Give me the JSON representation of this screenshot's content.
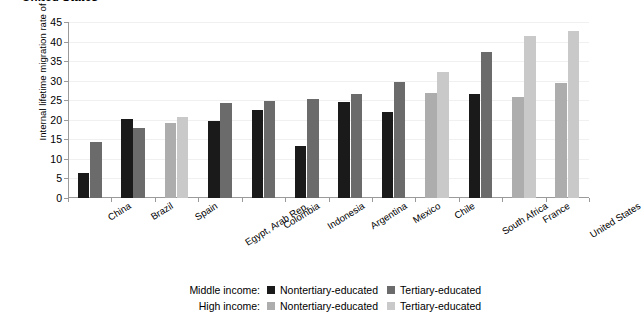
{
  "chart_data": {
    "type": "bar",
    "title": "United States",
    "xlabel": "",
    "ylabel": "Internal lifetime migration rate of the employed (%)",
    "ylim": [
      0,
      45
    ],
    "yticks": [
      0,
      5,
      10,
      15,
      20,
      25,
      30,
      35,
      40,
      45
    ],
    "grid": true,
    "legend_position": "bottom",
    "categories": [
      "China",
      "Brazil",
      "Spain",
      "Egypt, Arab Rep.",
      "Colombia",
      "Indonesia",
      "Argentina",
      "Mexico",
      "Chile",
      "South Africa",
      "France",
      "United States"
    ],
    "category_income_group": [
      "middle",
      "middle",
      "high",
      "middle",
      "middle",
      "middle",
      "middle",
      "middle",
      "high",
      "middle",
      "high",
      "high"
    ],
    "series": [
      {
        "name": "Nontertiary-educated",
        "values": [
          6.5,
          20.3,
          19.3,
          19.7,
          22.6,
          13.4,
          24.6,
          22.0,
          26.9,
          26.7,
          25.8,
          29.3
        ]
      },
      {
        "name": "Tertiary-educated",
        "values": [
          14.2,
          18.0,
          20.8,
          24.2,
          24.9,
          25.3,
          26.7,
          29.7,
          32.2,
          37.4,
          41.4,
          42.8
        ]
      }
    ]
  },
  "legend": {
    "rows": [
      {
        "head": "Middle income:",
        "entries": [
          {
            "label": "Nontertiary-educated",
            "color": "#1a1a1a"
          },
          {
            "label": "Tertiary-educated",
            "color": "#6b6b6b"
          }
        ]
      },
      {
        "head": "High income:",
        "entries": [
          {
            "label": "Nontertiary-educated",
            "color": "#adadad"
          },
          {
            "label": "Tertiary-educated",
            "color": "#c9c9c9"
          }
        ]
      }
    ]
  },
  "colors": {
    "middle_nontertiary": "#1a1a1a",
    "middle_tertiary": "#6b6b6b",
    "high_nontertiary": "#adadad",
    "high_tertiary": "#c9c9c9",
    "axis": "#9a9a9a",
    "gridline": "#f0f0f0",
    "background": "#ffffff"
  }
}
